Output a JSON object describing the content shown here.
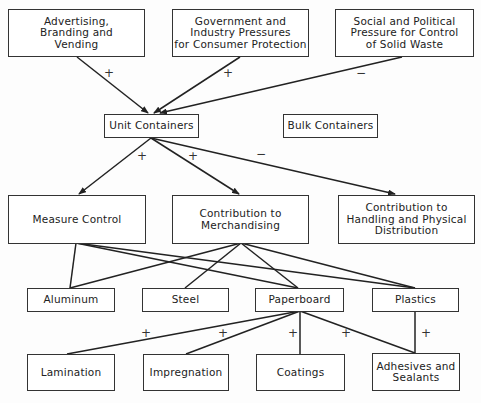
{
  "diagram": {
    "nodes": {
      "advertising": {
        "label": "Advertising,\nBranding and\nVending"
      },
      "government": {
        "label": "Government and\nIndustry Pressures\nfor Consumer Protection"
      },
      "social": {
        "label": "Social and Political\nPressure for Control\nof Solid Waste"
      },
      "unit_containers": {
        "label": "Unit Containers"
      },
      "bulk_containers": {
        "label": "Bulk Containers"
      },
      "measure_control": {
        "label": "Measure Control"
      },
      "merchandising": {
        "label": "Contribution to\nMerchandising"
      },
      "handling": {
        "label": "Contribution to\nHandling and Physical\nDistribution"
      },
      "aluminum": {
        "label": "Aluminum"
      },
      "steel": {
        "label": "Steel"
      },
      "paperboard": {
        "label": "Paperboard"
      },
      "plastics": {
        "label": "Plastics"
      },
      "lamination": {
        "label": "Lamination"
      },
      "impregnation": {
        "label": "Impregnation"
      },
      "coatings": {
        "label": "Coatings"
      },
      "adhesives": {
        "label": "Adhesives and\nSealants"
      }
    },
    "signs": {
      "advertising_to_unit": "+",
      "government_to_unit": "+",
      "social_to_unit": "−",
      "unit_to_measure": "+",
      "unit_to_merchandising": "+",
      "unit_to_handling": "−",
      "paperboard_to_lamination": "+",
      "paperboard_to_impregnation": "+",
      "paperboard_to_coatings": "+",
      "paperboard_to_adhesives": "+",
      "plastics_to_adhesives": "+"
    },
    "edges": [
      {
        "from": "advertising",
        "to": "unit_containers",
        "sign": "+",
        "arrow": true
      },
      {
        "from": "government",
        "to": "unit_containers",
        "sign": "+",
        "arrow": true
      },
      {
        "from": "social",
        "to": "unit_containers",
        "sign": "-",
        "arrow": true
      },
      {
        "from": "unit_containers",
        "to": "measure_control",
        "sign": "+",
        "arrow": true
      },
      {
        "from": "unit_containers",
        "to": "merchandising",
        "sign": "+",
        "arrow": true
      },
      {
        "from": "unit_containers",
        "to": "handling",
        "sign": "-",
        "arrow": true
      },
      {
        "from": "measure_control",
        "to": "aluminum",
        "arrow": false
      },
      {
        "from": "measure_control",
        "to": "paperboard",
        "arrow": false
      },
      {
        "from": "measure_control",
        "to": "plastics",
        "arrow": false
      },
      {
        "from": "merchandising",
        "to": "aluminum",
        "arrow": false
      },
      {
        "from": "merchandising",
        "to": "steel",
        "arrow": false
      },
      {
        "from": "merchandising",
        "to": "paperboard",
        "arrow": false
      },
      {
        "from": "merchandising",
        "to": "plastics",
        "arrow": false
      },
      {
        "from": "paperboard",
        "to": "lamination",
        "sign": "+",
        "arrow": false
      },
      {
        "from": "paperboard",
        "to": "impregnation",
        "sign": "+",
        "arrow": false
      },
      {
        "from": "paperboard",
        "to": "coatings",
        "sign": "+",
        "arrow": false
      },
      {
        "from": "paperboard",
        "to": "adhesives",
        "sign": "+",
        "arrow": false
      },
      {
        "from": "plastics",
        "to": "adhesives",
        "sign": "+",
        "arrow": false
      }
    ]
  }
}
